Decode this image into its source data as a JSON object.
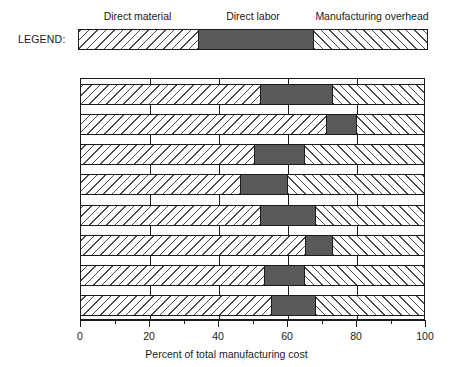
{
  "legend": {
    "caption": "LEGEND:",
    "labels": [
      {
        "text": "Direct material",
        "center_pct": 17
      },
      {
        "text": "Direct labor",
        "center_pct": 50
      },
      {
        "text": "Manufacturing overhead",
        "center_pct": 84
      }
    ],
    "segments": [
      {
        "name": "Direct material",
        "start": 0,
        "end": 34,
        "fill": "material"
      },
      {
        "name": "Direct labor",
        "start": 34,
        "end": 67,
        "fill": "labor"
      },
      {
        "name": "Manufacturing overhead",
        "start": 67,
        "end": 100,
        "fill": "overhead"
      }
    ]
  },
  "axis": {
    "title": "Percent of total manufacturing cost",
    "min": 0,
    "max": 100,
    "major_ticks": [
      0,
      20,
      40,
      60,
      80,
      100
    ],
    "minor_ticks": [
      10,
      30,
      50,
      70,
      90
    ],
    "tick_labels": [
      "0",
      "20",
      "40",
      "60",
      "80",
      "100"
    ]
  },
  "colors": {
    "labor_fill": "#5a5a5a",
    "hatch_stroke": "#4a4a4a",
    "outline": "#1a1a1a",
    "background": "#ffffff"
  },
  "chart_data": {
    "type": "bar",
    "orientation": "horizontal",
    "stacked": true,
    "title": "",
    "xlabel": "Percent of total manufacturing cost",
    "ylabel": "",
    "xlim": [
      0,
      100
    ],
    "grid": true,
    "legend_position": "top",
    "categories": [
      "Aerospace",
      "Computers",
      "Electronics",
      "General equip.",
      "Metal products",
      "Automobiles",
      "Scientific eq.",
      "Average"
    ],
    "series": [
      {
        "name": "Direct material",
        "values": [
          52,
          71,
          50,
          46,
          52,
          65,
          53,
          55
        ]
      },
      {
        "name": "Direct labor",
        "values": [
          21,
          9,
          15,
          14,
          16,
          8,
          12,
          13
        ]
      },
      {
        "name": "Manufacturing overhead",
        "values": [
          27,
          20,
          35,
          40,
          32,
          27,
          35,
          32
        ]
      }
    ],
    "cumulative_boundaries": [
      {
        "category": "Aerospace",
        "material_end": 52,
        "labor_end": 73
      },
      {
        "category": "Computers",
        "material_end": 71,
        "labor_end": 80
      },
      {
        "category": "Electronics",
        "material_end": 50,
        "labor_end": 65
      },
      {
        "category": "General equip.",
        "material_end": 46,
        "labor_end": 60
      },
      {
        "category": "Metal products",
        "material_end": 52,
        "labor_end": 68
      },
      {
        "category": "Automobiles",
        "material_end": 65,
        "labor_end": 73
      },
      {
        "category": "Scientific eq.",
        "material_end": 53,
        "labor_end": 65
      },
      {
        "category": "Average",
        "material_end": 55,
        "labor_end": 68
      }
    ]
  }
}
